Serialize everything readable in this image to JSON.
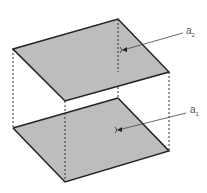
{
  "diagram": {
    "fill_color": "#bdbdbd",
    "edge_color": "#222222",
    "labels": {
      "upper_plane": {
        "base": "a",
        "subscript": "2"
      },
      "lower_plane": {
        "base": "a",
        "subscript": "1"
      }
    }
  }
}
